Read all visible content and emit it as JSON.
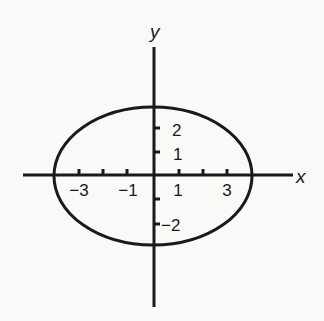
{
  "diagram": {
    "title": "",
    "axes": {
      "x_label": "x",
      "y_label": "y",
      "origin_px": [
        154,
        175
      ],
      "x_unit_px": 24.5,
      "y_unit_px": 23.5
    },
    "x_ticks": [
      -4,
      -3,
      -2,
      -1,
      1,
      2,
      3,
      4
    ],
    "x_tick_labels": [
      {
        "value": -3,
        "text": "−3"
      },
      {
        "value": -1,
        "text": "−1"
      },
      {
        "value": 1,
        "text": "1"
      },
      {
        "value": 3,
        "text": "3"
      }
    ],
    "y_ticks": [
      -2,
      -1,
      1,
      2
    ],
    "y_tick_labels": [
      {
        "value": 2,
        "text": "2"
      },
      {
        "value": 1,
        "text": "1"
      },
      {
        "value": -2,
        "text": "−2"
      }
    ],
    "ellipse": {
      "center": [
        0,
        0
      ],
      "semi_major_x": 4,
      "semi_minor_y": 3,
      "equation": "x^2/16 + y^2/9 = 1"
    },
    "colors": {
      "ink": "#1a1a1a",
      "background": "#f9f9f8"
    }
  }
}
